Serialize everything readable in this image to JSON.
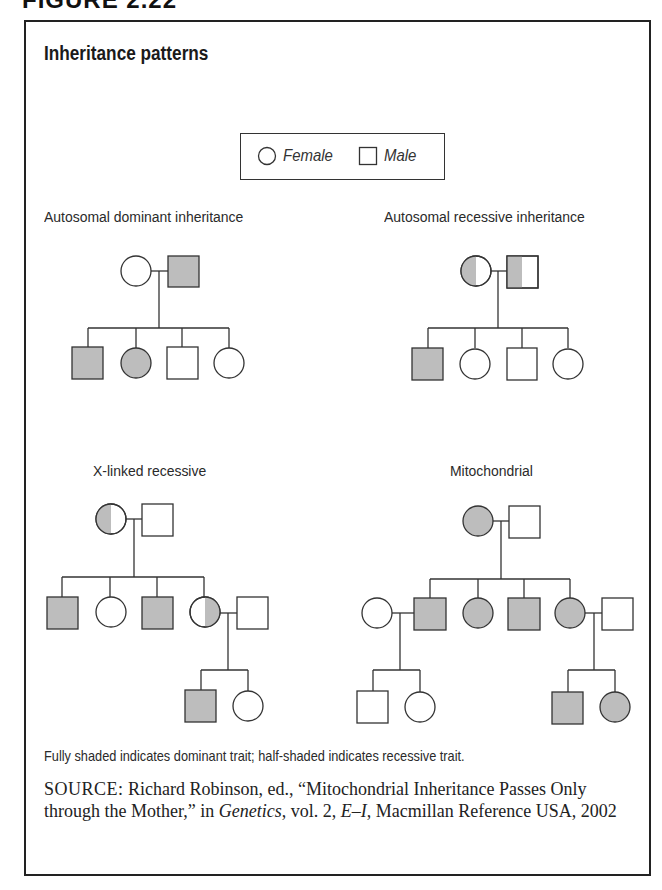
{
  "figure_label": "FIGURE 2.22",
  "title": "Inheritance patterns",
  "legend": {
    "female_label": "Female",
    "male_label": "Male"
  },
  "panels": [
    {
      "id": "autosomal-dominant",
      "label": "Autosomal dominant inheritance"
    },
    {
      "id": "autosomal-recessive",
      "label": "Autosomal recessive inheritance"
    },
    {
      "id": "x-linked-recessive",
      "label": "X-linked recessive"
    },
    {
      "id": "mitochondrial",
      "label": "Mitochondrial"
    }
  ],
  "colors": {
    "shade": "#bdbdbd",
    "stroke": "#333333"
  },
  "note": "Fully shaded indicates dominant trait; half-shaded indicates recessive trait.",
  "source": {
    "prefix": "SOURCE:",
    "part1": " Richard Robinson, ed., “Mitochondrial Inheritance Passes Only through the Mother,” in ",
    "book": "Genetics",
    "part2": ", vol. 2, ",
    "volume_range": "E–I",
    "part3": ", Macmillan Reference USA, 2002"
  }
}
